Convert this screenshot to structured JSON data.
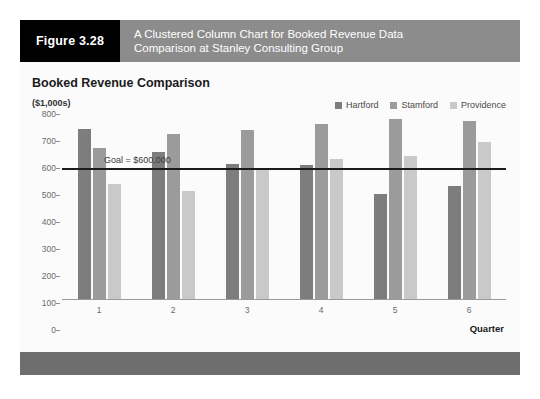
{
  "figure": {
    "number_label": "Figure 3.28",
    "caption_line1": "A Clustered Column Chart for Booked Revenue Data",
    "caption_line2": "Comparison at Stanley Consulting Group"
  },
  "colors": {
    "header_band": "#8c8c8c",
    "number_block": "#000000",
    "footer_band": "#6e6e6e",
    "hartford": "#7d7d7d",
    "stamford": "#9b9b9b",
    "providence": "#c9c9c9",
    "goal_line": "#1b1b1b"
  },
  "chart_data": {
    "type": "bar",
    "title": "Booked Revenue Comparison",
    "subtitle": "($1,000s)",
    "xlabel": "Quarter",
    "ylabel": "($1,000s)",
    "categories": [
      "1",
      "2",
      "3",
      "4",
      "5",
      "6"
    ],
    "series": [
      {
        "name": "Hartford",
        "color": "#7d7d7d",
        "values": [
          630,
          545,
          500,
          495,
          390,
          420
        ]
      },
      {
        "name": "Stamford",
        "color": "#9b9b9b",
        "values": [
          560,
          610,
          625,
          650,
          665,
          660
        ]
      },
      {
        "name": "Providence",
        "color": "#c9c9c9",
        "values": [
          425,
          400,
          485,
          520,
          530,
          580
        ]
      }
    ],
    "ylim": [
      0,
      800
    ],
    "yticks": [
      800,
      700,
      600,
      500,
      400,
      300,
      200,
      100,
      0
    ],
    "grid": false,
    "legend_position": "top-right",
    "annotations": [
      {
        "type": "reference-line",
        "label": "Goal = $600,000",
        "value": 600
      }
    ]
  }
}
